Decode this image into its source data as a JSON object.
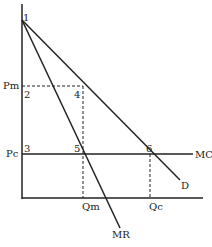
{
  "diagram": {
    "labels": {
      "pm": "Pm",
      "pc": "Pc",
      "qm": "Qm",
      "qc": "Qc",
      "mc": "MC",
      "d": "D",
      "mr": "MR",
      "p1": "1",
      "p2": "2",
      "p3": "3",
      "p4": "4",
      "p5": "5",
      "p6": "6"
    },
    "colors": {
      "line": "#222222",
      "background": "#ffffff"
    }
  }
}
